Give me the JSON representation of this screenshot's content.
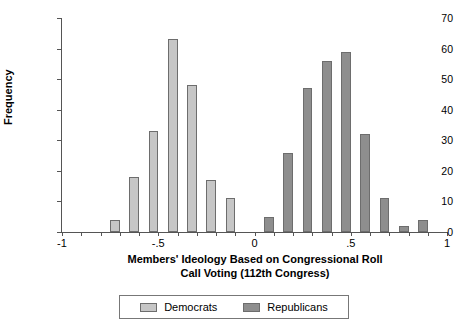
{
  "chart_data": {
    "type": "bar",
    "title": "",
    "xlabel_lines": [
      "Members' Ideology Based on Congressional Roll",
      "Call Voting (112th Congress)"
    ],
    "ylabel": "Frequency",
    "ylim": [
      0,
      70
    ],
    "xlim": [
      -1,
      1
    ],
    "yticks": [
      0,
      10,
      20,
      30,
      40,
      50,
      60,
      70
    ],
    "ytick_labels": [
      "0",
      "10",
      "20",
      "30",
      "40",
      "50",
      "60",
      "70"
    ],
    "xticks": [
      -1,
      -0.5,
      0,
      0.5,
      1
    ],
    "xtick_labels": [
      "-1",
      "-.5",
      "0",
      ".5",
      "1"
    ],
    "minor_xticks": [
      -0.9,
      -0.8,
      -0.7,
      -0.6,
      -0.4,
      -0.3,
      -0.2,
      -0.1,
      0.1,
      0.2,
      0.3,
      0.4,
      0.6,
      0.7,
      0.8,
      0.9
    ],
    "grid": false,
    "legend_position": "bottom",
    "bin_width": 0.05,
    "series": [
      {
        "name": "Democrats",
        "color": "#c6c6c6",
        "bins": [
          {
            "x0": -0.75,
            "x1": -0.7,
            "value": 4
          },
          {
            "x0": -0.65,
            "x1": -0.6,
            "value": 18
          },
          {
            "x0": -0.55,
            "x1": -0.5,
            "value": 33
          },
          {
            "x0": -0.45,
            "x1": -0.4,
            "value": 63
          },
          {
            "x0": -0.35,
            "x1": -0.3,
            "value": 48
          },
          {
            "x0": -0.25,
            "x1": -0.2,
            "value": 17
          },
          {
            "x0": -0.15,
            "x1": -0.1,
            "value": 11
          }
        ]
      },
      {
        "name": "Republicans",
        "color": "#8e8e8e",
        "bins": [
          {
            "x0": 0.05,
            "x1": 0.1,
            "value": 5
          },
          {
            "x0": 0.15,
            "x1": 0.2,
            "value": 26
          },
          {
            "x0": 0.25,
            "x1": 0.3,
            "value": 47
          },
          {
            "x0": 0.35,
            "x1": 0.4,
            "value": 56
          },
          {
            "x0": 0.45,
            "x1": 0.5,
            "value": 59
          },
          {
            "x0": 0.55,
            "x1": 0.6,
            "value": 32
          },
          {
            "x0": 0.65,
            "x1": 0.7,
            "value": 11
          },
          {
            "x0": 0.75,
            "x1": 0.8,
            "value": 2
          },
          {
            "x0": 0.85,
            "x1": 0.9,
            "value": 4
          }
        ]
      }
    ]
  },
  "legend": {
    "items": [
      {
        "label": "Democrats",
        "swatch": "dem"
      },
      {
        "label": "Republicans",
        "swatch": "rep"
      }
    ]
  }
}
